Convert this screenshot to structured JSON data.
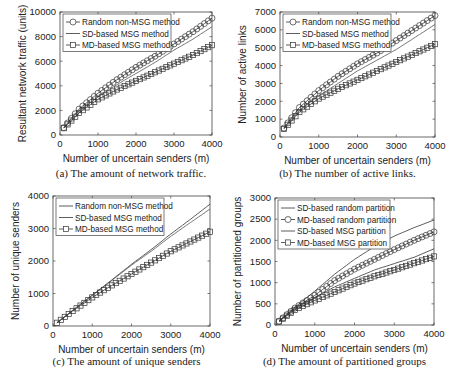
{
  "chart_data": [
    {
      "id": "a",
      "type": "line",
      "caption": "(a) The amount of network traffic.",
      "xlabel": "Number of uncertain senders (m)",
      "ylabel": "Resultant network traffic (units)",
      "xlim": [
        0,
        4000
      ],
      "ylim": [
        0,
        10000
      ],
      "xticks": [
        0,
        1000,
        2000,
        3000,
        4000
      ],
      "yticks": [
        0,
        2000,
        4000,
        6000,
        8000,
        10000
      ],
      "grid": false,
      "legend_position": "upper left",
      "x": [
        100,
        500,
        1000,
        1500,
        2000,
        2500,
        3000,
        3500,
        4000
      ],
      "series": [
        {
          "name": "Random non-MSG method",
          "marker": "circle",
          "values": [
            600,
            2100,
            3400,
            4500,
            5500,
            6400,
            7400,
            8400,
            9500
          ]
        },
        {
          "name": "SD-based MSG method",
          "marker": "none",
          "values": [
            600,
            1950,
            3100,
            4100,
            5000,
            5900,
            6900,
            7800,
            8800
          ]
        },
        {
          "name": "MD-based MSG method",
          "marker": "square",
          "values": [
            550,
            1800,
            2900,
            3700,
            4400,
            5100,
            5800,
            6500,
            7300
          ]
        }
      ]
    },
    {
      "id": "b",
      "type": "line",
      "caption": "(b) The number of active links.",
      "xlabel": "Number of uncertain senders (m)",
      "ylabel": "Number of active links",
      "xlim": [
        0,
        4000
      ],
      "ylim": [
        0,
        7000
      ],
      "xticks": [
        0,
        1000,
        2000,
        3000,
        4000
      ],
      "yticks": [
        0,
        1000,
        2000,
        3000,
        4000,
        5000,
        6000,
        7000
      ],
      "grid": false,
      "legend_position": "upper left",
      "x": [
        100,
        500,
        1000,
        1500,
        2000,
        2500,
        3000,
        3500,
        4000
      ],
      "series": [
        {
          "name": "Random non-MSG method",
          "marker": "circle",
          "values": [
            500,
            1650,
            2600,
            3400,
            4100,
            4700,
            5400,
            6100,
            6800
          ]
        },
        {
          "name": "SD-based MSG method",
          "marker": "none",
          "values": [
            500,
            1500,
            2300,
            3000,
            3700,
            4300,
            4900,
            5600,
            6300
          ]
        },
        {
          "name": "MD-based MSG method",
          "marker": "square",
          "values": [
            450,
            1400,
            2150,
            2700,
            3200,
            3700,
            4200,
            4700,
            5200
          ]
        }
      ]
    },
    {
      "id": "c",
      "type": "line",
      "caption": "(c) The amount of unique senders",
      "xlabel": "Number of uncertain senders (m)",
      "ylabel": "Number of unique senders",
      "xlim": [
        0,
        4000
      ],
      "ylim": [
        0,
        4000
      ],
      "xticks": [
        0,
        1000,
        2000,
        3000,
        4000
      ],
      "yticks": [
        0,
        1000,
        2000,
        3000,
        4000
      ],
      "grid": false,
      "legend_position": "upper left",
      "x": [
        100,
        500,
        1000,
        1500,
        2000,
        2500,
        3000,
        3500,
        4000
      ],
      "series": [
        {
          "name": "Random non-MSG method",
          "marker": "none",
          "values": [
            100,
            480,
            950,
            1420,
            1900,
            2350,
            2830,
            3280,
            3750
          ]
        },
        {
          "name": "SD-based MSG method",
          "marker": "none",
          "values": [
            100,
            480,
            940,
            1400,
            1870,
            2300,
            2760,
            3180,
            3600
          ]
        },
        {
          "name": "MD-based MSG method",
          "marker": "square",
          "values": [
            100,
            460,
            880,
            1250,
            1600,
            1950,
            2300,
            2600,
            2900
          ]
        }
      ]
    },
    {
      "id": "d",
      "type": "line",
      "caption": "(d) The amount of partitioned groups",
      "xlabel": "Number of uncertain senders (m)",
      "ylabel": "Number of partitioned groups",
      "xlim": [
        0,
        4000
      ],
      "ylim": [
        0,
        3000
      ],
      "xticks": [
        0,
        1000,
        2000,
        3000,
        4000
      ],
      "yticks": [
        0,
        500,
        1000,
        1500,
        2000,
        2500,
        3000
      ],
      "grid": false,
      "legend_position": "upper left",
      "x": [
        100,
        500,
        1000,
        1500,
        2000,
        2500,
        3000,
        3500,
        4000
      ],
      "series": [
        {
          "name": "SD-based random partition",
          "marker": "none",
          "values": [
            100,
            420,
            800,
            1200,
            1550,
            1850,
            2100,
            2300,
            2480
          ]
        },
        {
          "name": "MD-based random partition",
          "marker": "circle",
          "values": [
            90,
            400,
            700,
            1050,
            1320,
            1550,
            1780,
            2000,
            2200
          ]
        },
        {
          "name": "SD-based MSG partition",
          "marker": "none",
          "values": [
            90,
            380,
            650,
            900,
            1100,
            1300,
            1450,
            1600,
            1800
          ]
        },
        {
          "name": "MD-based MSG partition",
          "marker": "square",
          "values": [
            80,
            360,
            580,
            780,
            980,
            1150,
            1300,
            1460,
            1620
          ]
        }
      ]
    }
  ],
  "layout": {
    "panels": [
      {
        "plot": [
          60,
          12,
          212,
          135
        ],
        "caption_y": 177
      },
      {
        "plot": [
          280,
          12,
          435,
          137
        ],
        "caption_y": 177
      },
      {
        "plot": [
          53,
          196,
          210,
          326
        ],
        "caption_y": 365
      },
      {
        "plot": [
          275,
          198,
          434,
          325
        ],
        "caption_y": 365
      }
    ]
  }
}
